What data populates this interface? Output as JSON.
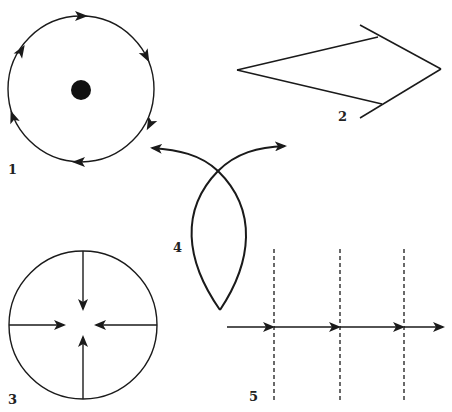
{
  "figure": {
    "background": "#ffffff",
    "stroke_color": "#1a1a1a",
    "panels": [
      {
        "id": 1,
        "label": "1",
        "description": "Closed circular orbit with clockwise arrows around a central dot",
        "label_pos": [
          13,
          174
        ]
      },
      {
        "id": 2,
        "label": "2",
        "description": "Kite / arrowhead shape of straight line segments pointing right",
        "label_pos": [
          339,
          121
        ]
      },
      {
        "id": 3,
        "label": "3",
        "description": "Circle with four arrows pointing inward toward the center",
        "label_pos": [
          9,
          404
        ]
      },
      {
        "id": 4,
        "label": "4",
        "description": "Lens-shaped loop whose curves cross and end in outward arrows",
        "label_pos": [
          173,
          252
        ]
      },
      {
        "id": 5,
        "label": "5",
        "description": "Horizontal arrow crossing three vertical dashed lines",
        "label_pos": [
          249,
          401
        ]
      }
    ]
  }
}
